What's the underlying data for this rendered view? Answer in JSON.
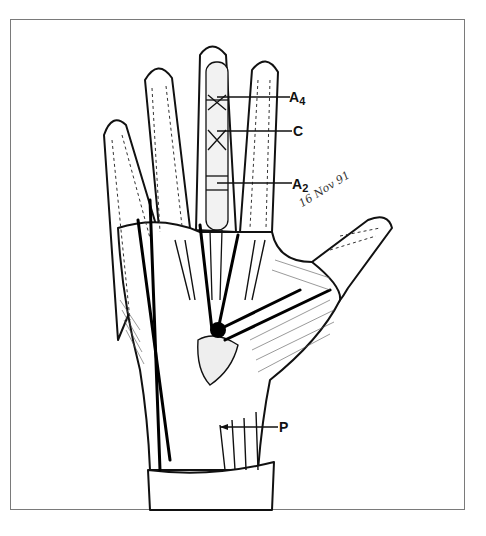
{
  "figure": {
    "type": "anatomical-illustration",
    "labels": [
      {
        "id": "A4",
        "text": "A",
        "sub": "4",
        "target": "A4 annular pulley, middle finger"
      },
      {
        "id": "C",
        "text": "C",
        "sub": "",
        "target": "cruciate pulley, middle finger"
      },
      {
        "id": "A2",
        "text": "A",
        "sub": "2",
        "target": "A2 annular pulley, middle finger"
      },
      {
        "id": "P",
        "text": "P",
        "sub": "",
        "target": "palmaris / wrist structure"
      }
    ],
    "signature": "16 Nov 91",
    "colors": {
      "ink": "#111111",
      "frame": "#7a7a7a",
      "background": "#ffffff"
    }
  }
}
